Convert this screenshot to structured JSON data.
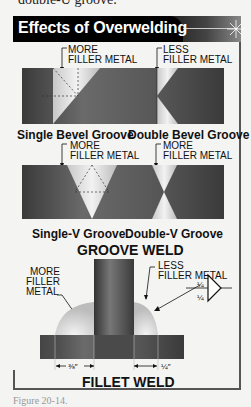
{
  "page": {
    "top_text": "double-U groove.",
    "bottom_text": "Figure 20-14."
  },
  "header": {
    "title": "Effects of Overwelding"
  },
  "groove_section": {
    "row1": {
      "left_label": [
        "MORE",
        "FILLER METAL"
      ],
      "right_label": [
        "LESS",
        "FILLER METAL"
      ],
      "captions": [
        "Single Bevel Groove",
        "Double Bevel Groove"
      ]
    },
    "row2": {
      "left_label": [
        "MORE",
        "FILLER METAL"
      ],
      "right_label": [
        "LESS",
        "FILLER METAL"
      ],
      "captions": [
        "Single-V Groove",
        "Double-V Groove"
      ]
    },
    "title": "GROOVE WELD"
  },
  "fillet_section": {
    "left_label": [
      "MORE",
      "FILLER",
      "METAL"
    ],
    "right_label": [
      "LESS",
      "FILLER METAL"
    ],
    "symbol_top": "¼",
    "symbol_bottom": "¼",
    "dim_left": "⅜″",
    "dim_right": "¼″",
    "title": "FILLET WELD"
  },
  "colors": {
    "header_bg": "#000000",
    "plate_dark": "#4a4a4a",
    "weld_light": "#d8d8d8",
    "frame": "#555555"
  }
}
